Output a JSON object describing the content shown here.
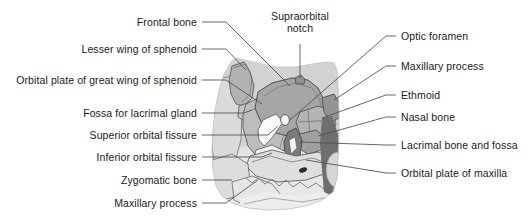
{
  "figure": {
    "kind": "anatomical-diagram",
    "background_color": "#ffffff",
    "label_text_color": "#1a1a1a",
    "leader_line_color": "#4d4d4d"
  },
  "illustration": {
    "palette": {
      "outer_skull": "#d2d2d2",
      "pale_bone": "#e4e4e4",
      "light_bone": "#dcdcdc",
      "mid_gray": "#b6b6b6",
      "sphenoid_body": "#a8a8a8",
      "dark_gray": "#8e8e8e",
      "darkest_strip": "#6f6f6f",
      "fissure_white": "#fbfbfb",
      "outline": "#555555"
    },
    "regions": [
      "frontal bone",
      "lesser wing of sphenoid",
      "orbital plate of great wing of sphenoid",
      "fossa for lacrimal gland",
      "superior orbital fissure",
      "inferior orbital fissure",
      "zygomatic bone",
      "maxillary process",
      "supraorbital notch",
      "optic foramen",
      "ethmoid",
      "nasal bone",
      "lacrimal bone and fossa",
      "orbital plate of maxilla"
    ]
  },
  "labels": {
    "left": [
      {
        "text": "Frontal bone",
        "x_end": 197,
        "y": 22
      },
      {
        "text": "Lesser wing of sphenoid",
        "x_end": 197,
        "y": 49
      },
      {
        "text": "Orbital plate of great wing of sphenoid",
        "x_end": 197,
        "y": 80
      },
      {
        "text": "Fossa for lacrimal gland",
        "x_end": 197,
        "y": 113
      },
      {
        "text": "Superior orbital fissure",
        "x_end": 197,
        "y": 135
      },
      {
        "text": "Inferior orbital fissure",
        "x_end": 197,
        "y": 157
      },
      {
        "text": "Zygomatic bone",
        "x_end": 197,
        "y": 180
      },
      {
        "text": "Maxillary process",
        "x_end": 197,
        "y": 203
      }
    ],
    "top": [
      {
        "text_line_1": "Supraorbital",
        "text_line_2": "notch",
        "x_center": 300,
        "y": 14
      }
    ],
    "right": [
      {
        "text": "Optic foramen",
        "x_start": 401,
        "y": 36
      },
      {
        "text": "Maxillary process",
        "x_start": 401,
        "y": 66
      },
      {
        "text": "Ethmoid",
        "x_start": 401,
        "y": 95
      },
      {
        "text": "Nasal bone",
        "x_start": 401,
        "y": 117
      },
      {
        "text": "Lacrimal bone and fossa",
        "x_start": 401,
        "y": 145
      },
      {
        "text": "Orbital plate of maxilla",
        "x_start": 401,
        "y": 173
      }
    ]
  }
}
